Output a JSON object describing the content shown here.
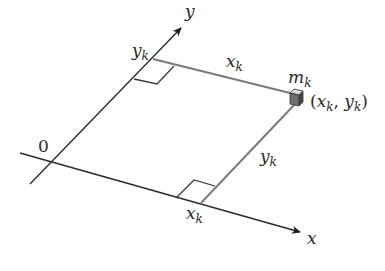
{
  "diagram": {
    "type": "coordinate-geometry",
    "axes": {
      "x_label": "x",
      "y_label": "y",
      "origin_label": "0"
    },
    "labels": {
      "y_k_on_axis": "y",
      "y_k_on_axis_sub": "k",
      "x_k_on_axis": "x",
      "x_k_on_axis_sub": "k",
      "x_k_distance": "x",
      "x_k_distance_sub": "k",
      "y_k_distance": "y",
      "y_k_distance_sub": "k",
      "mass": "m",
      "mass_sub": "k",
      "coord_open": "(",
      "coord_x": "x",
      "coord_x_sub": "k",
      "coord_sep": ", ",
      "coord_y": "y",
      "coord_y_sub": "k",
      "coord_close": ")"
    },
    "colors": {
      "axis": "#2b2b2b",
      "distance_line": "#7a7a7a",
      "cube_front": "#6e6e6e",
      "cube_top": "#d8d8d8",
      "cube_side": "#4a4a4a"
    }
  }
}
